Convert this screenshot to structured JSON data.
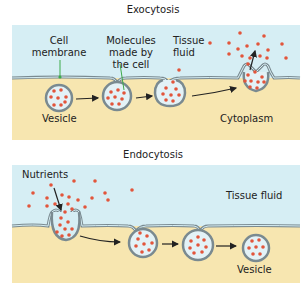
{
  "exocytosis": {
    "title": "Exocytosis",
    "labels": {
      "cell_membrane": [
        "Cell",
        "membrane"
      ],
      "molecules": [
        "Molecules",
        "made by",
        "the cell"
      ],
      "tissue_fluid": [
        "Tissue",
        "fluid"
      ],
      "vesicle": "Vesicle",
      "cytoplasm": "Cytoplasm"
    }
  },
  "endocytosis": {
    "title": "Endocytosis",
    "labels": {
      "nutrients": "Nutrients",
      "tissue_fluid": "Tissue fluid",
      "vesicle": "Vesicle"
    }
  },
  "colors": {
    "fluid": "#d6eef4",
    "cytoplasm": "#f7e6b0",
    "membrane": "#7a8a90",
    "vesicle_fill": "#e3f2f7",
    "molecule": "#e2553b",
    "pointer": "#3daa4a",
    "arrow": "#222222"
  }
}
